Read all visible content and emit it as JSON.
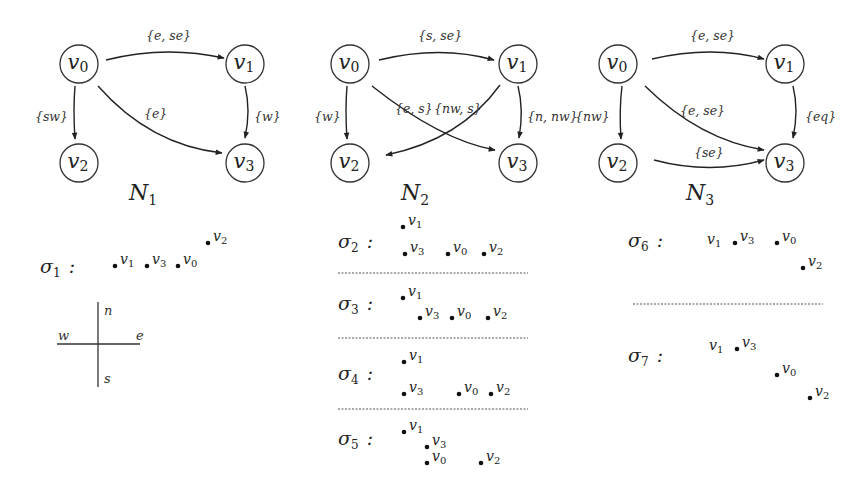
{
  "networks": [
    {
      "id": "N1",
      "label": "N",
      "label_sub": "1",
      "nodes": [
        {
          "id": "v0",
          "name": "v",
          "sub": "0"
        },
        {
          "id": "v1",
          "name": "v",
          "sub": "1"
        },
        {
          "id": "v2",
          "name": "v",
          "sub": "2"
        },
        {
          "id": "v3",
          "name": "v",
          "sub": "3"
        }
      ],
      "edges": [
        {
          "from": "v0",
          "to": "v1",
          "label": "{e, se}"
        },
        {
          "from": "v0",
          "to": "v2",
          "label": "{sw}"
        },
        {
          "from": "v0",
          "to": "v3",
          "label": "{e}"
        },
        {
          "from": "v1",
          "to": "v3",
          "label": "{w}"
        }
      ]
    },
    {
      "id": "N2",
      "label": "N",
      "label_sub": "2",
      "nodes": [
        {
          "id": "v0",
          "name": "v",
          "sub": "0"
        },
        {
          "id": "v1",
          "name": "v",
          "sub": "1"
        },
        {
          "id": "v2",
          "name": "v",
          "sub": "2"
        },
        {
          "id": "v3",
          "name": "v",
          "sub": "3"
        }
      ],
      "edges": [
        {
          "from": "v0",
          "to": "v1",
          "label": "{s, se}"
        },
        {
          "from": "v0",
          "to": "v2",
          "label": "{w}"
        },
        {
          "from": "v0",
          "to": "v3",
          "label": "{e, s}"
        },
        {
          "from": "v1",
          "to": "v2",
          "label": "{nw, s}"
        },
        {
          "from": "v1",
          "to": "v3",
          "label": "{n, nw}"
        }
      ]
    },
    {
      "id": "N3",
      "label": "N",
      "label_sub": "3",
      "nodes": [
        {
          "id": "v0",
          "name": "v",
          "sub": "0"
        },
        {
          "id": "v1",
          "name": "v",
          "sub": "1"
        },
        {
          "id": "v2",
          "name": "v",
          "sub": "2"
        },
        {
          "id": "v3",
          "name": "v",
          "sub": "3"
        }
      ],
      "edges": [
        {
          "from": "v0",
          "to": "v1",
          "label": "{e, se}"
        },
        {
          "from": "v0",
          "to": "v2",
          "label": "{nw}"
        },
        {
          "from": "v0",
          "to": "v3",
          "label": "{e, se}"
        },
        {
          "from": "v1",
          "to": "v3",
          "label": "{eq}"
        },
        {
          "from": "v2",
          "to": "v3",
          "label": "{se}"
        }
      ]
    }
  ],
  "scenarios": [
    {
      "id": "sigma1",
      "label": "σ",
      "sub": "1",
      "colon": ":",
      "network": "N1",
      "points": [
        {
          "name": "v",
          "sub": "1"
        },
        {
          "name": "v",
          "sub": "3"
        },
        {
          "name": "v",
          "sub": "0"
        },
        {
          "name": "v",
          "sub": "2"
        }
      ]
    },
    {
      "id": "sigma2",
      "label": "σ",
      "sub": "2",
      "colon": ":",
      "network": "N2",
      "points": [
        {
          "name": "v",
          "sub": "1"
        },
        {
          "name": "v",
          "sub": "3"
        },
        {
          "name": "v",
          "sub": "0"
        },
        {
          "name": "v",
          "sub": "2"
        }
      ]
    },
    {
      "id": "sigma3",
      "label": "σ",
      "sub": "3",
      "colon": ":",
      "network": "N2",
      "points": [
        {
          "name": "v",
          "sub": "1"
        },
        {
          "name": "v",
          "sub": "3"
        },
        {
          "name": "v",
          "sub": "0"
        },
        {
          "name": "v",
          "sub": "2"
        }
      ]
    },
    {
      "id": "sigma4",
      "label": "σ",
      "sub": "4",
      "colon": ":",
      "network": "N2",
      "points": [
        {
          "name": "v",
          "sub": "1"
        },
        {
          "name": "v",
          "sub": "3"
        },
        {
          "name": "v",
          "sub": "0"
        },
        {
          "name": "v",
          "sub": "2"
        }
      ]
    },
    {
      "id": "sigma5",
      "label": "σ",
      "sub": "5",
      "colon": ":",
      "network": "N2",
      "points": [
        {
          "name": "v",
          "sub": "1"
        },
        {
          "name": "v",
          "sub": "3"
        },
        {
          "name": "v",
          "sub": "0"
        },
        {
          "name": "v",
          "sub": "2"
        }
      ]
    },
    {
      "id": "sigma6",
      "label": "σ",
      "sub": "6",
      "colon": ":",
      "network": "N3",
      "points": [
        {
          "name": "v",
          "sub": "1"
        },
        {
          "name": "v",
          "sub": "3"
        },
        {
          "name": "v",
          "sub": "0"
        },
        {
          "name": "v",
          "sub": "2"
        }
      ]
    },
    {
      "id": "sigma7",
      "label": "σ",
      "sub": "7",
      "colon": ":",
      "network": "N3",
      "points": [
        {
          "name": "v",
          "sub": "1"
        },
        {
          "name": "v",
          "sub": "3"
        },
        {
          "name": "v",
          "sub": "0"
        },
        {
          "name": "v",
          "sub": "2"
        }
      ]
    }
  ],
  "compass": {
    "n": "n",
    "s": "s",
    "e": "e",
    "w": "w"
  }
}
